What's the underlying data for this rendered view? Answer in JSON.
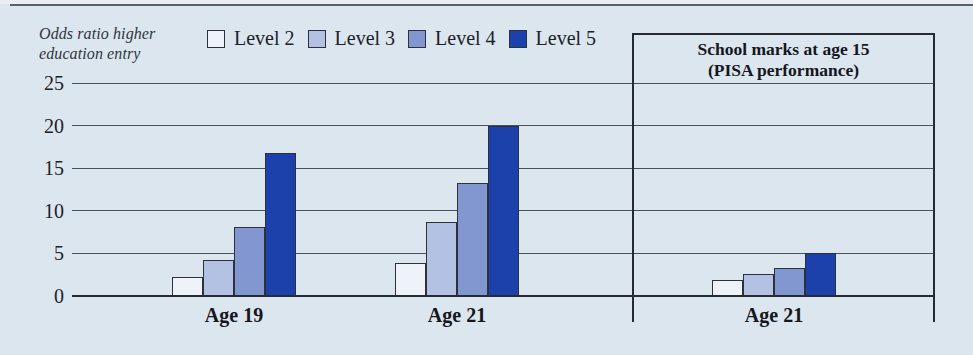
{
  "figure": {
    "y_axis_unit_label": {
      "line1": "Odds ratio higher",
      "line2": "education entry"
    }
  },
  "right_panel": {
    "title_line1": "School marks at age 15",
    "title_line2": "(PISA performance)"
  },
  "colors": {
    "background": "#dce6ef",
    "gridline": "#4a505d",
    "axis_line": "#262b33",
    "bar_border": "#2c313c",
    "text": "#1d2127",
    "level2": "#eef3f9",
    "level3": "#b3c2e2",
    "level4": "#8296cf",
    "level5": "#1c41ab"
  },
  "chart_data": {
    "type": "bar",
    "title": "",
    "ylabel": "Odds ratio higher education entry",
    "ylim": [
      0,
      25
    ],
    "yticks": [
      0,
      5,
      10,
      15,
      20,
      25
    ],
    "grid": true,
    "legend_position": "top",
    "legend_entries": [
      "Level 2",
      "Level 3",
      "Level 4",
      "Level 5"
    ],
    "categories": [
      "Age 19",
      "Age 21",
      "Age 21"
    ],
    "panels": [
      {
        "title": "",
        "category_indexes": [
          0,
          1
        ]
      },
      {
        "title": "School marks at age 15 (PISA performance)",
        "category_indexes": [
          2
        ]
      }
    ],
    "series": [
      {
        "name": "Level 2",
        "color": "#eef3f9",
        "values": [
          2.2,
          3.9,
          1.9
        ]
      },
      {
        "name": "Level 3",
        "color": "#b3c2e2",
        "values": [
          4.2,
          8.7,
          2.6
        ]
      },
      {
        "name": "Level 4",
        "color": "#8296cf",
        "values": [
          8.1,
          13.3,
          3.3
        ]
      },
      {
        "name": "Level 5",
        "color": "#1c41ab",
        "values": [
          16.8,
          19.9,
          5.0
        ]
      }
    ]
  }
}
